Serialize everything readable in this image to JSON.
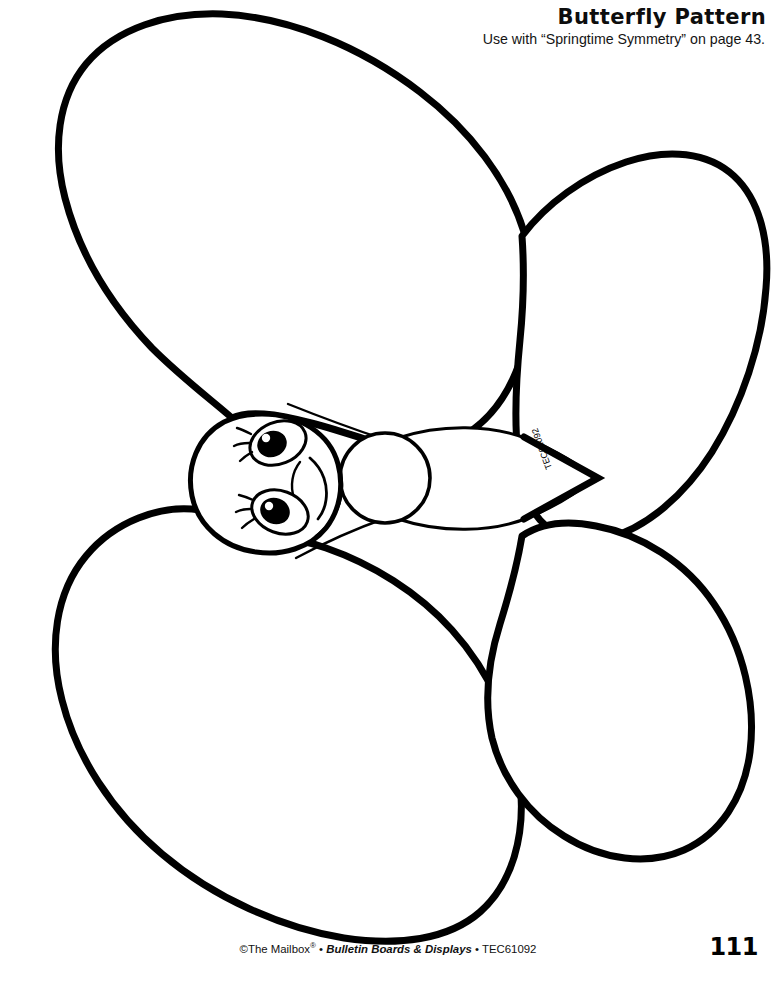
{
  "document": {
    "kind": "printable-activity-pattern-page",
    "background_color": "#ffffff",
    "ink_color": "#000000"
  },
  "header": {
    "title": "Butterfly Pattern",
    "subtitle": "Use with “Springtime Symmetry” on page 43."
  },
  "artwork": {
    "name": "butterfly-pattern-outline",
    "description": "Large black-outline butterfly cut-out pattern with four wings, round head with two eyes and a smiling mouth, a round thorax, a pointed oval abdomen and two antennae.",
    "stroke_color": "#000000",
    "fill_color": "#ffffff",
    "wing_label": "TEC61092",
    "parts": [
      "upper-left-wing",
      "upper-right-wing",
      "lower-left-wing",
      "lower-right-wing",
      "head",
      "thorax",
      "abdomen",
      "antenna-upper",
      "antenna-lower",
      "eye-upper",
      "eye-lower",
      "mouth"
    ]
  },
  "footer": {
    "copyright": "©The Mailbox",
    "registered_mark": "®",
    "separator": " • ",
    "series": "Bulletin Boards & Displays",
    "product_code": "TEC61092",
    "page_number": "111"
  }
}
